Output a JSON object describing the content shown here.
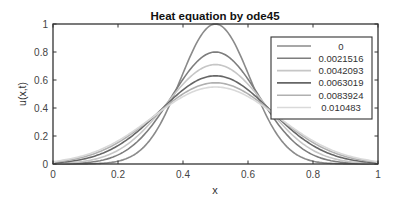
{
  "chart_data": {
    "type": "line",
    "title": "Heat equation by ode45",
    "xlabel": "x",
    "ylabel": "u(x,t)",
    "xlim": [
      0,
      1
    ],
    "ylim": [
      0,
      1
    ],
    "xticks": [
      "0",
      "0.2",
      "0.4",
      "0.6",
      "0.8",
      "1"
    ],
    "yticks": [
      "0",
      "0.2",
      "0.4",
      "0.6",
      "0.8",
      "1"
    ],
    "grid": false,
    "legend_position": "northeast",
    "series": [
      {
        "name": "0",
        "color": "#8a8a8a",
        "peak": 1.0,
        "values_at_x": {
          "0": 0.0,
          "0.2": 0.02,
          "0.3": 0.18,
          "0.35": 0.38,
          "0.4": 0.65,
          "0.5": 1.0,
          "0.6": 0.65,
          "0.65": 0.38,
          "0.7": 0.18,
          "0.8": 0.02,
          "1": 0.0
        }
      },
      {
        "name": "0.0021516",
        "color": "#7d7d7d",
        "peak": 0.8
      },
      {
        "name": "0.0042093",
        "color": "#c6c6c6",
        "peak": 0.71
      },
      {
        "name": "0.0063019",
        "color": "#666666",
        "peak": 0.63
      },
      {
        "name": "0.0083924",
        "color": "#b0b0b0",
        "peak": 0.58
      },
      {
        "name": "0.010483",
        "color": "#d9d9d9",
        "peak": 0.55
      }
    ]
  }
}
